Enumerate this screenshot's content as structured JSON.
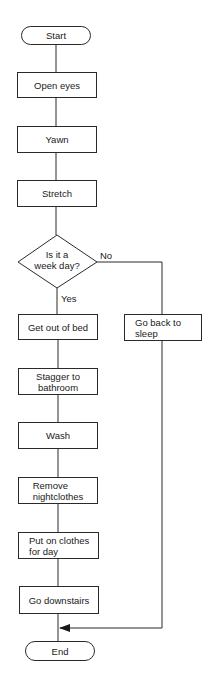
{
  "flowchart": {
    "start": "Start",
    "steps": [
      "Open eyes",
      "Yawn",
      "Stretch"
    ],
    "decision": {
      "line1": "Is it a",
      "line2": "week day?",
      "yes_label": "Yes",
      "no_label": "No"
    },
    "yes_branch": [
      "Get out of bed",
      {
        "line1": "Stagger to",
        "line2": "bathroom"
      },
      "Wash",
      {
        "line1": "Remove",
        "line2": "nightclothes"
      },
      {
        "line1": "Put on clothes",
        "line2": "for day"
      },
      "Go downstairs"
    ],
    "no_branch": {
      "line1": "Go back to",
      "line2": "sleep"
    },
    "end": "End"
  }
}
